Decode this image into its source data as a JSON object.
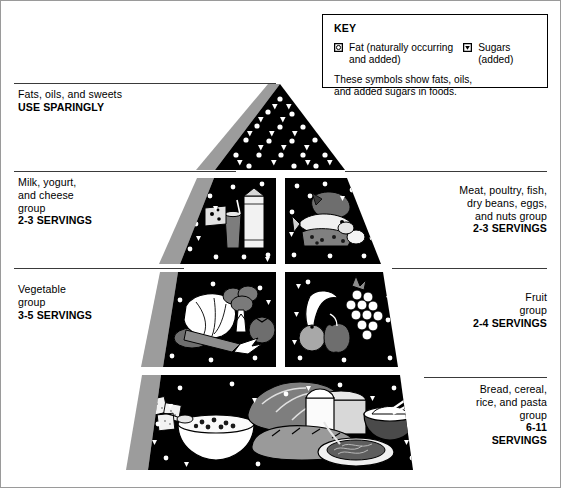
{
  "key": {
    "title": "KEY",
    "fat": {
      "symbol": "fat-circle-symbol",
      "line1": "Fat (naturally occurring",
      "line2": "and added)"
    },
    "sugars": {
      "symbol": "sugar-triangle-symbol",
      "line1": "Sugars",
      "line2": "(added)"
    },
    "note_line1": "These symbols show fats, oils,",
    "note_line2": "and added sugars in foods."
  },
  "tiers": {
    "fats": {
      "name_line1": "Fats, oils, and sweets",
      "servings": "USE SPARINGLY",
      "foods": [
        "fat-circles",
        "sugar-triangles"
      ]
    },
    "milk": {
      "name_line1": "Milk, yogurt,",
      "name_line2": "and cheese",
      "name_line3": "group",
      "servings": "2-3 SERVINGS",
      "foods": [
        "cheese-wedge",
        "milk-glass",
        "milk-carton"
      ]
    },
    "meat": {
      "name_line1": "Meat, poultry, fish,",
      "name_line2": "dry beans, eggs,",
      "name_line3": "and nuts group",
      "servings": "2-3 SERVINGS",
      "foods": [
        "fish",
        "meat-cut",
        "beans",
        "eggs"
      ]
    },
    "vegetable": {
      "name_line1": "Vegetable",
      "name_line2": "group",
      "servings": "3-5 SERVINGS",
      "foods": [
        "lettuce",
        "broccoli",
        "carrot",
        "tomato",
        "eggplant"
      ]
    },
    "fruit": {
      "name_line1": "Fruit",
      "name_line2": "group",
      "servings": "2-4 SERVINGS",
      "foods": [
        "banana",
        "grapes",
        "apple",
        "orange",
        "pineapple"
      ]
    },
    "bread": {
      "name_line1": "Bread, cereal,",
      "name_line2": "rice, and pasta",
      "name_line3": "group",
      "servings_line1": "6-11",
      "servings_line2": "SERVINGS",
      "foods": [
        "crackers",
        "cereal-bowl",
        "bread-loaf",
        "sliced-bread",
        "pasta-plate",
        "rice-bowl"
      ]
    }
  },
  "colors": {
    "tier_fill": "#000000",
    "symbol_fill": "#ffffff",
    "shadow": "#9c9c9c",
    "rule": "#3a3a3a",
    "page_border": "#9a9a9a",
    "food_light": "#ffffff",
    "food_mid": "#b4b4b4",
    "food_dark": "#6e6e6e"
  }
}
